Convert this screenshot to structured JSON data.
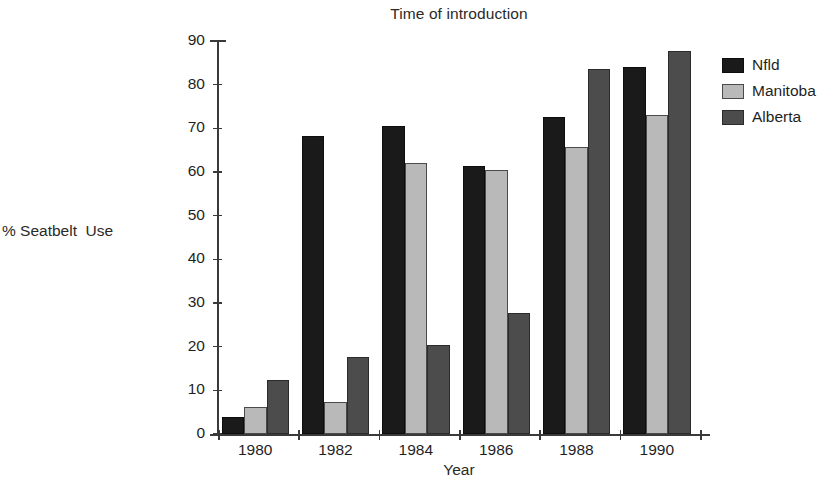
{
  "chart_data": {
    "type": "bar",
    "title": "Time of introduction",
    "xlabel": "Year",
    "ylabel": "% Seatbelt  Use",
    "categories": [
      "1980",
      "1982",
      "1984",
      "1986",
      "1988",
      "1990"
    ],
    "series": [
      {
        "name": "Nfld",
        "color": "#1a1a1a",
        "values": [
          4.0,
          68.3,
          70.5,
          61.3,
          72.5,
          84.0
        ]
      },
      {
        "name": "Manitoba",
        "color": "#b9b9b9",
        "values": [
          6.3,
          7.3,
          62.0,
          60.5,
          65.8,
          73.0
        ]
      },
      {
        "name": "Alberta",
        "color": "#4c4c4c",
        "values": [
          12.3,
          17.6,
          20.3,
          27.8,
          83.5,
          87.7
        ]
      }
    ],
    "ylim": [
      0,
      90
    ],
    "yticks": [
      0,
      10,
      20,
      30,
      40,
      50,
      60,
      70,
      80,
      90
    ],
    "ytick_labels": [
      "0",
      "10",
      "20",
      "30",
      "40",
      "50",
      "60",
      "70",
      "80",
      "90"
    ],
    "grid": false,
    "legend_position": "right"
  }
}
